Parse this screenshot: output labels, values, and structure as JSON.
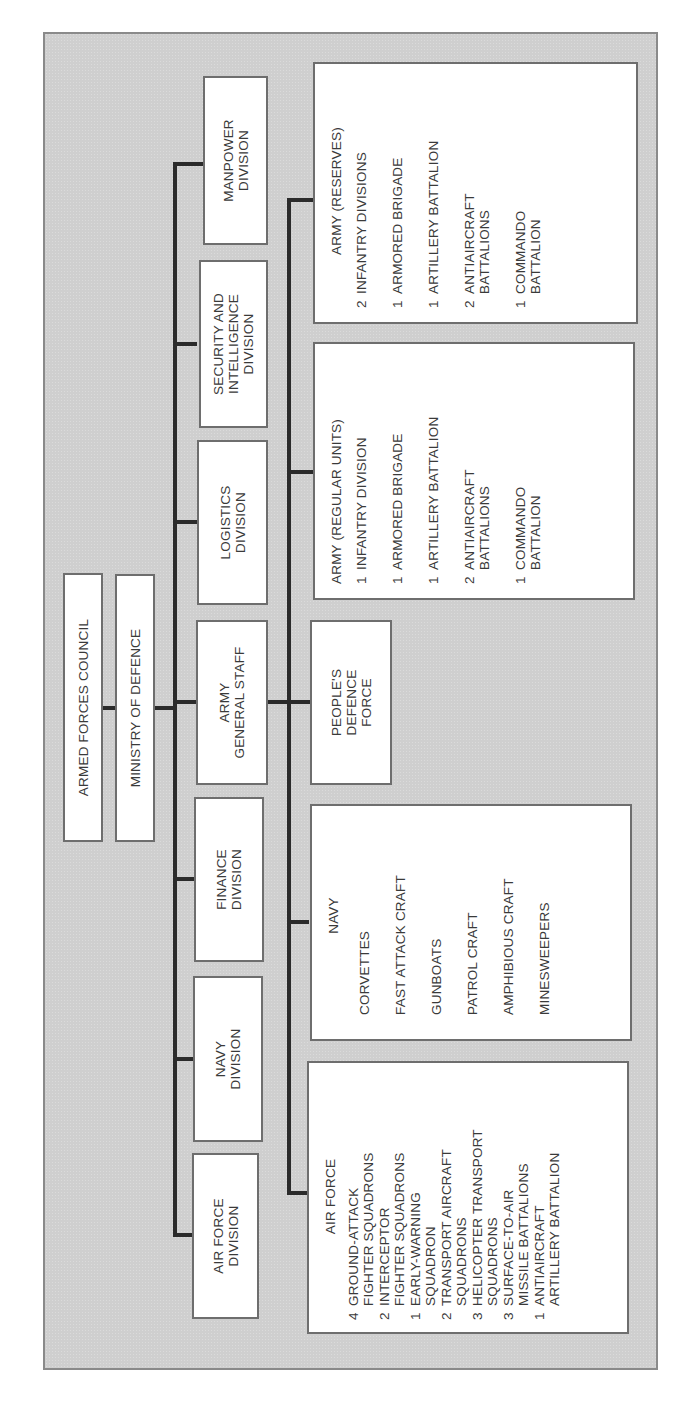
{
  "chart_title": "Armed Forces Organization",
  "top": {
    "council": "ARMED FORCES COUNCIL",
    "ministry": "MINISTRY OF DEFENCE"
  },
  "divisions": [
    {
      "id": "air-force-division",
      "label": "AIR FORCE\nDIVISION"
    },
    {
      "id": "navy-division",
      "label": "NAVY\nDIVISION"
    },
    {
      "id": "finance-division",
      "label": "FINANCE\nDIVISION"
    },
    {
      "id": "army-general-staff",
      "label": "ARMY\nGENERAL STAFF"
    },
    {
      "id": "logistics-division",
      "label": "LOGISTICS\nDIVISION"
    },
    {
      "id": "security-intelligence-division",
      "label": "SECURITY AND\nINTELLIGENCE\nDIVISION"
    },
    {
      "id": "manpower-division",
      "label": "MANPOWER\nDIVISION"
    }
  ],
  "forces": {
    "air_force": {
      "title": "AIR FORCE",
      "items": [
        {
          "n": "4",
          "t": "GROUND-ATTACK\nFIGHTER SQUADRONS"
        },
        {
          "n": "2",
          "t": "INTERCEPTOR\nFIGHTER SQUADRONS"
        },
        {
          "n": "1",
          "t": "EARLY-WARNING\nSQUADRON"
        },
        {
          "n": "2",
          "t": "TRANSPORT AIRCRAFT\nSQUADRONS"
        },
        {
          "n": "3",
          "t": "HELICOPTER TRANSPORT\nSQUADRONS"
        },
        {
          "n": "3",
          "t": "SURFACE-TO-AIR\nMISSILE BATTALIONS"
        },
        {
          "n": "1",
          "t": "ANTIAIRCRAFT\nARTILLERY BATTALION"
        }
      ]
    },
    "navy": {
      "title": "NAVY",
      "items": [
        {
          "n": "",
          "t": "CORVETTES"
        },
        {
          "n": "",
          "t": "FAST ATTACK CRAFT"
        },
        {
          "n": "",
          "t": "GUNBOATS"
        },
        {
          "n": "",
          "t": "PATROL CRAFT"
        },
        {
          "n": "",
          "t": "AMPHIBIOUS CRAFT"
        },
        {
          "n": "",
          "t": "MINESWEEPERS"
        }
      ]
    },
    "peoples_defence_force": {
      "title": "PEOPLE'S\nDEFENCE\nFORCE"
    },
    "army_regular": {
      "title": "ARMY (REGULAR UNITS)",
      "items": [
        {
          "n": "1",
          "t": "INFANTRY DIVISION"
        },
        {
          "n": "1",
          "t": "ARMORED BRIGADE"
        },
        {
          "n": "1",
          "t": "ARTILLERY BATTALION"
        },
        {
          "n": "2",
          "t": "ANTIAIRCRAFT\nBATTALIONS"
        },
        {
          "n": "1",
          "t": "COMMANDO\nBATTALION"
        }
      ]
    },
    "army_reserves": {
      "title": "ARMY (RESERVES)",
      "items": [
        {
          "n": "2",
          "t": "INFANTRY DIVISIONS"
        },
        {
          "n": "1",
          "t": "ARMORED BRIGADE"
        },
        {
          "n": "1",
          "t": "ARTILLERY BATTALION"
        },
        {
          "n": "2",
          "t": "ANTIAIRCRAFT\nBATTALIONS"
        },
        {
          "n": "1",
          "t": "COMMANDO\nBATTALION"
        }
      ]
    }
  },
  "colors": {
    "background": "#cfcfcf",
    "box": "#ffffff",
    "line": "#2b2b2b",
    "border": "#6e6e6e"
  }
}
